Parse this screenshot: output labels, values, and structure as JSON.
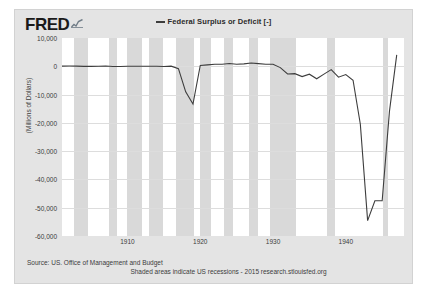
{
  "brand": {
    "logo_text": "FRED",
    "logo_icon": "sparkline-icon"
  },
  "legend": {
    "series_label": "Federal Surplus or Deficit [-]",
    "line_color": "#3d3d3d"
  },
  "footer": {
    "source": "Source: US. Office of Management and Budget",
    "note": "Shaded areas indicate US recessions - 2015 research.stlouisfed.org"
  },
  "colors": {
    "card_background": "#e4e4e4",
    "plot_background": "#ffffff",
    "recession_band": "#d9d9d9",
    "gridline": "#dddddd",
    "series": "#3d3d3d"
  },
  "chart_data": {
    "type": "line",
    "title": "Federal Surplus or Deficit [-]",
    "xlabel": "",
    "ylabel": "(Millions of Dollars)",
    "xlim": [
      1901,
      1948
    ],
    "ylim": [
      -60000,
      10000
    ],
    "grid": true,
    "legend_position": "top-center",
    "ytick_labels": [
      "10,000",
      "0",
      "-10,000",
      "-20,000",
      "-30,000",
      "-40,000",
      "-50,000",
      "-60,000"
    ],
    "ytick_values": [
      10000,
      0,
      -10000,
      -20000,
      -30000,
      -40000,
      -50000,
      -60000
    ],
    "xtick_labels": [
      "1910",
      "1920",
      "1930",
      "1940"
    ],
    "xtick_values": [
      1910,
      1920,
      1930,
      1940
    ],
    "series": [
      {
        "name": "Federal Surplus or Deficit [-]",
        "color": "#3d3d3d",
        "x": [
          1901,
          1902,
          1903,
          1904,
          1905,
          1906,
          1907,
          1908,
          1909,
          1910,
          1911,
          1912,
          1913,
          1914,
          1915,
          1916,
          1917,
          1918,
          1919,
          1920,
          1921,
          1922,
          1923,
          1924,
          1925,
          1926,
          1927,
          1928,
          1929,
          1930,
          1931,
          1932,
          1933,
          1934,
          1935,
          1936,
          1937,
          1938,
          1939,
          1940,
          1941,
          1942,
          1943,
          1944,
          1945,
          1946,
          1947
        ],
        "values": [
          63,
          77,
          45,
          -43,
          -23,
          25,
          87,
          -57,
          -89,
          20,
          12,
          3,
          -1,
          0,
          -63,
          48,
          -853,
          -9032,
          -13363,
          291,
          509,
          736,
          713,
          963,
          717,
          865,
          1155,
          939,
          734,
          738,
          -462,
          -2735,
          -2602,
          -3630,
          -2791,
          -4425,
          -2777,
          -1177,
          -3862,
          -2920,
          -4941,
          -20503,
          -54554,
          -47557,
          -47553,
          -15936,
          4018
        ],
        "annotations": [
          {
            "label": "WWI deficit trough",
            "x": 1919,
            "y": -13363
          },
          {
            "label": "WWII deficit trough",
            "x": 1943,
            "y": -54554
          }
        ]
      }
    ],
    "recession_bands": [
      {
        "start": 1902.7,
        "end": 1904.6
      },
      {
        "start": 1907.4,
        "end": 1908.5
      },
      {
        "start": 1910.0,
        "end": 1912.0
      },
      {
        "start": 1913.0,
        "end": 1914.9
      },
      {
        "start": 1916.6,
        "end": 1919.2
      },
      {
        "start": 1920.0,
        "end": 1921.5
      },
      {
        "start": 1923.3,
        "end": 1924.5
      },
      {
        "start": 1926.7,
        "end": 1927.9
      },
      {
        "start": 1929.6,
        "end": 1933.2
      },
      {
        "start": 1937.4,
        "end": 1938.5
      },
      {
        "start": 1945.1,
        "end": 1945.8
      }
    ]
  }
}
